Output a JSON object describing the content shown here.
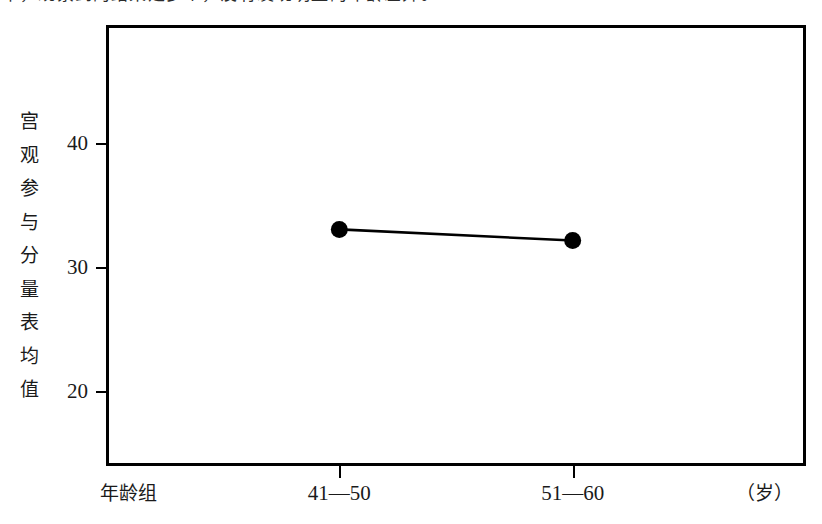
{
  "page": {
    "scan_top_text": "中，观察到的结果是多个，没有发现明显的年龄差异。"
  },
  "chart_data": {
    "type": "line",
    "title": "",
    "xlabel": "年龄组",
    "xunit": "（岁）",
    "ylabel": "宫观参与分量表均值",
    "ylabel_chars": [
      "宫",
      "观",
      "参",
      "与",
      "分",
      "量",
      "表",
      "均",
      "值"
    ],
    "categories": [
      "41—50",
      "51—60"
    ],
    "values": [
      33.1,
      32.2
    ],
    "yticks": [
      20,
      30,
      40
    ],
    "ytick_labels": [
      "20",
      "30",
      "40"
    ],
    "ylim": [
      14,
      49.6
    ],
    "grid": false,
    "legend": false,
    "marker": "filled-circle",
    "line_color": "#000000",
    "marker_color": "#000000",
    "frame_color": "#000000",
    "background": "#ffffff"
  }
}
